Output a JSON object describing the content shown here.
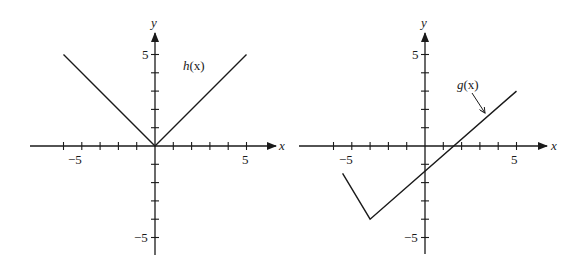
{
  "chart_data": [
    {
      "type": "line",
      "title": "h(x)",
      "function_label": "h(x)",
      "xlabel": "x",
      "ylabel": "y",
      "xlim": [
        -6.5,
        6.5
      ],
      "ylim": [
        -5.8,
        6.2
      ],
      "x_ticks": [
        -5,
        -4,
        -3,
        -2,
        -1,
        1,
        2,
        3,
        4,
        5
      ],
      "y_ticks": [
        -5,
        -4,
        -3,
        -2,
        -1,
        1,
        2,
        3,
        4,
        5
      ],
      "tick_labels": {
        "x": [
          "-5",
          "5"
        ],
        "y": [
          "5",
          "-5"
        ]
      },
      "grid": false,
      "series": [
        {
          "name": "h(x)",
          "x": [
            -5,
            0,
            5
          ],
          "y": [
            5,
            0,
            5
          ]
        }
      ]
    },
    {
      "type": "line",
      "title": "g(x)",
      "function_label": "g(x)",
      "xlabel": "x",
      "ylabel": "y",
      "xlim": [
        -6.8,
        6.5
      ],
      "ylim": [
        -5.8,
        6.2
      ],
      "x_ticks": [
        -5,
        -4,
        -3,
        -2,
        -1,
        1,
        2,
        3,
        4,
        5
      ],
      "y_ticks": [
        -5,
        -4,
        -3,
        -2,
        -1,
        1,
        2,
        3,
        4,
        5
      ],
      "tick_labels": {
        "x": [
          "-5",
          "5"
        ],
        "y": [
          "5",
          "-5"
        ]
      },
      "grid": false,
      "annotations": [
        {
          "text": "g(x)",
          "arrow_to": [
            3.3,
            1.8
          ]
        }
      ],
      "series": [
        {
          "name": "g(x)",
          "x": [
            -4.5,
            -3,
            5
          ],
          "y": [
            -1.5,
            -4,
            3
          ]
        }
      ]
    }
  ],
  "left": {
    "x_axis_label": "x",
    "y_axis_label": "y",
    "x_tick_neg": "−5",
    "x_tick_pos": "5",
    "y_tick_pos": "5",
    "y_tick_neg": "−5",
    "func_label_name": "h",
    "func_label_arg": "(x)"
  },
  "right": {
    "x_axis_label": "x",
    "y_axis_label": "y",
    "x_tick_neg": "−5",
    "x_tick_pos": "5",
    "y_tick_pos": "5",
    "y_tick_neg": "−5",
    "func_label_name": "g",
    "func_label_arg": "(x)"
  }
}
